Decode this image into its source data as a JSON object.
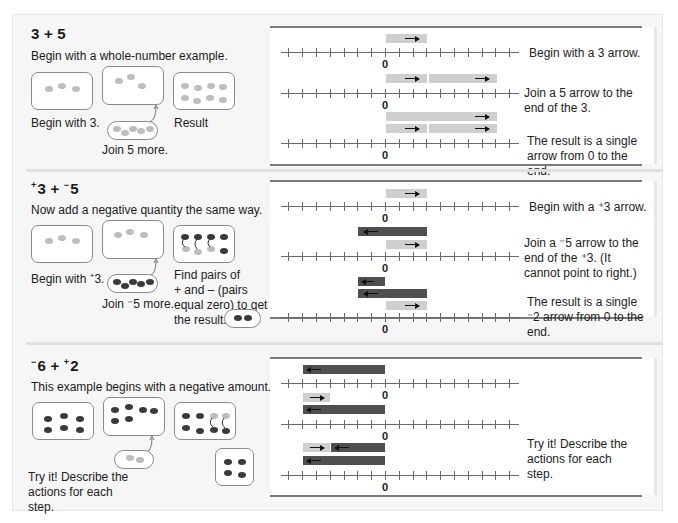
{
  "sections": [
    {
      "title_parts": [
        "",
        "3 + 5"
      ],
      "subtitle": "Begin with a whole-number example.",
      "captions": {
        "begin": "Begin with 3.",
        "join": "Join 5 more.",
        "result": "Result"
      },
      "steps": [
        "Begin with a 3 arrow.",
        "Join a 5 arrow to the end of the 3.",
        "The result is a single arrow from 0 to the end."
      ],
      "zero_label": "0"
    },
    {
      "title": {
        "sign1": "+",
        "n1": "3",
        "op": " + ",
        "sign2": "−",
        "n2": "5"
      },
      "subtitle": "Now add a negative quantity the same way.",
      "captions": {
        "begin": "Begin with ",
        "begin_sup": "+",
        "begin_num": "3.",
        "join": "Join ⁻5 more.",
        "result_lines": [
          "Find pairs of",
          "+ and – (pairs",
          "equal zero) to get",
          "the result."
        ]
      },
      "steps": [
        "Begin with a ⁺3 arrow.",
        "Join a ⁻5 arrow to the end of  the ⁺3. (It cannot point to right.)",
        "The result is a single ⁻2 arrow from 0 to the end."
      ],
      "zero_label": "0"
    },
    {
      "title": {
        "sign1": "−",
        "n1": "6",
        "op": " + ",
        "sign2": "+",
        "n2": "2"
      },
      "subtitle": "This example begins with a negative amount.",
      "captions": {
        "try": "Try it! Describe the actions for each step."
      },
      "steps": [
        "Try it! Describe the actions for each step."
      ],
      "zero_label": "0"
    }
  ],
  "colors": {
    "positive_counter": "#bdbdbd",
    "negative_counter": "#3a3a3a",
    "positive_bar": "#cfcfcf",
    "negative_bar": "#4f4f4f"
  }
}
